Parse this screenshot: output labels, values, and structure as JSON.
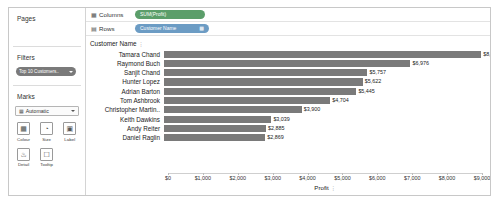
{
  "sidebar": {
    "pages": {
      "title": "Pages"
    },
    "filters": {
      "title": "Filters",
      "pill_label": "Top 10 Customers..",
      "pill_icon": "filter-caret-icon"
    },
    "marks": {
      "title": "Marks",
      "type_icon": "bar-mark-icon",
      "type_value": "Automatic",
      "buttons": [
        {
          "label": "Colour",
          "icon": "colour-icon",
          "glyph": "▦"
        },
        {
          "label": "Size",
          "icon": "size-icon",
          "glyph": "◔"
        },
        {
          "label": "Label",
          "icon": "label-icon",
          "glyph": "▣"
        },
        {
          "label": "Detail",
          "icon": "detail-icon",
          "glyph": "⚬"
        },
        {
          "label": "Tooltip",
          "icon": "tooltip-icon",
          "glyph": "○"
        }
      ]
    }
  },
  "shelves": {
    "columns": {
      "label": "Columns",
      "icon": "columns-icon",
      "pill": "SUM(Profit)"
    },
    "rows": {
      "label": "Rows",
      "icon": "rows-icon",
      "pill": "Customer Name",
      "pill_icon": "sort-icon"
    }
  },
  "viz": {
    "row_header": "Customer Name",
    "row_header_icon": "sort-icon"
  },
  "chart_data": {
    "type": "bar",
    "orientation": "horizontal",
    "title": "",
    "xlabel": "Profit",
    "ylabel": "Customer Name",
    "xlim": [
      0,
      9000
    ],
    "grid": false,
    "categories": [
      "Tamara Chand",
      "Raymond Buch",
      "Sanjit Chand",
      "Hunter Lopez",
      "Adrian Barton",
      "Tom Ashbrook",
      "Christopher Martin..",
      "Keith Dawkins",
      "Andy Reiter",
      "Daniel Raglin"
    ],
    "values": [
      8981,
      6976,
      5757,
      5622,
      5445,
      4704,
      3900,
      3039,
      2885,
      2869
    ],
    "value_labels": [
      "$8,981",
      "$6,976",
      "$5,757",
      "$5,622",
      "$5,445",
      "$4,704",
      "$3,900",
      "$3,039",
      "$2,885",
      "$2,869"
    ],
    "xticks": [
      0,
      1000,
      2000,
      3000,
      4000,
      5000,
      6000,
      7000,
      8000,
      9000
    ],
    "xtick_labels": [
      "$0",
      "$1,000",
      "$2,000",
      "$3,000",
      "$4,000",
      "$5,000",
      "$6,000",
      "$7,000",
      "$8,000",
      "$9,000"
    ],
    "bar_color": "#7a7a7a"
  },
  "colors": {
    "measure_pill": "#5b9e6a",
    "dimension_pill": "#6c9cc4",
    "filter_pill": "#7a7a7a",
    "bar": "#7a7a7a"
  }
}
